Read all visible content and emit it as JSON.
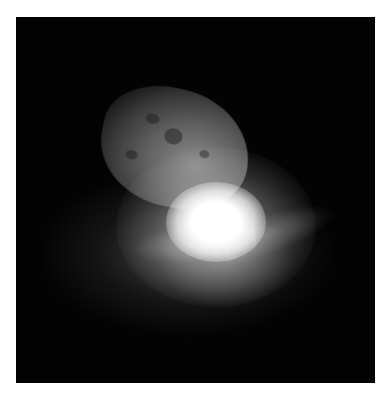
{
  "image": {
    "subject": "comet nucleus with bright impact flash and ejecta plume",
    "background_color": "#030303",
    "frame_color": "#ffffff"
  }
}
